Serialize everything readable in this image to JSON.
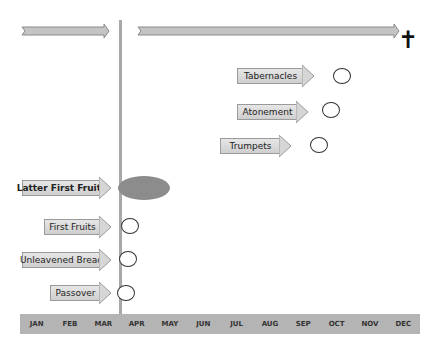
{
  "timeline_arrows": [
    {
      "name": "pre-passover-arrow",
      "x": 22,
      "y": 28,
      "width": 86
    },
    {
      "name": "post-pentecost-arrow",
      "x": 138,
      "y": 28,
      "width": 260
    }
  ],
  "end_symbol": {
    "name": "cross",
    "glyph": "✝"
  },
  "feasts": {
    "fall": [
      {
        "label": "Tabernacles"
      },
      {
        "label": "Atonement"
      },
      {
        "label": "Trumpets"
      }
    ],
    "spring": [
      {
        "label": "Latter First Fruits"
      },
      {
        "label": "First Fruits"
      },
      {
        "label": "Unleavened Bread"
      },
      {
        "label": "Passover"
      }
    ]
  },
  "months": [
    "JAN",
    "FEB",
    "MAR",
    "APR",
    "MAY",
    "JUN",
    "JUL",
    "AUG",
    "SEP",
    "OCT",
    "NOV",
    "DEC"
  ],
  "colors": {
    "line": "#a8a8a8",
    "arrow_fill": "#d6d6d6",
    "month_bar": "#b4b4b4",
    "ellipse": "#8c8c8c"
  }
}
